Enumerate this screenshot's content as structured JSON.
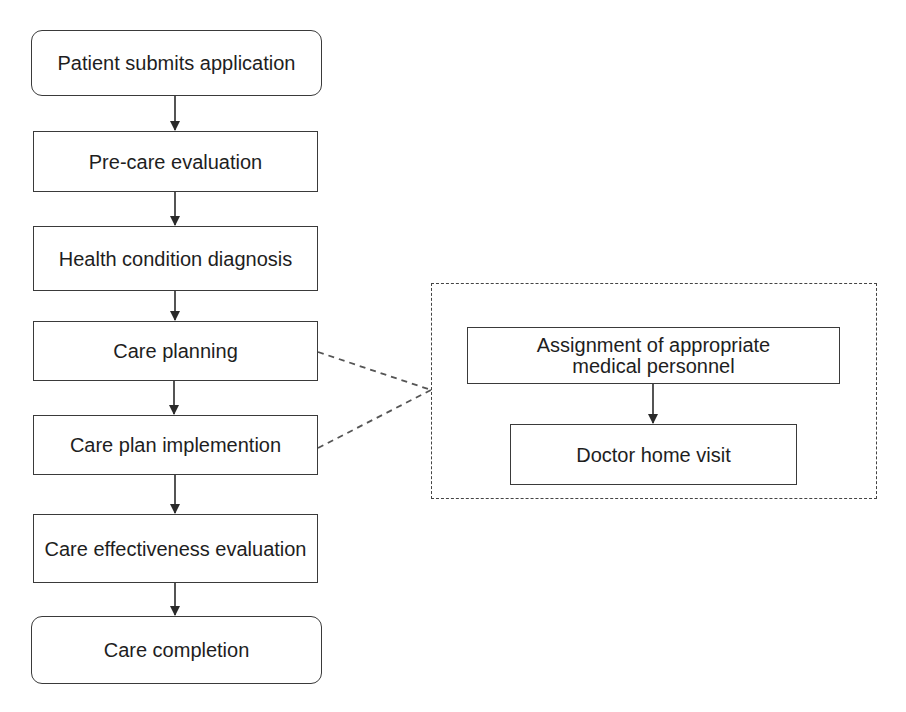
{
  "diagram": {
    "type": "flowchart",
    "main_flow": [
      {
        "id": "step1",
        "label": "Patient submits application",
        "shape": "rounded"
      },
      {
        "id": "step2",
        "label": "Pre-care evaluation",
        "shape": "rect"
      },
      {
        "id": "step3",
        "label": "Health condition diagnosis",
        "shape": "rect"
      },
      {
        "id": "step4",
        "label": "Care planning",
        "shape": "rect"
      },
      {
        "id": "step5",
        "label": "Care plan implemention",
        "shape": "rect"
      },
      {
        "id": "step6",
        "label": "Care effectiveness evaluation",
        "shape": "rect"
      },
      {
        "id": "step7",
        "label": "Care completion",
        "shape": "rounded"
      }
    ],
    "detail_group": {
      "linked_from": [
        "Care planning",
        "Care plan implemention"
      ],
      "steps": [
        {
          "id": "detail1",
          "label": "Assignment of appropriate medical personnel"
        },
        {
          "id": "detail2",
          "label": "Doctor home visit"
        }
      ]
    },
    "colors": {
      "stroke": "#3a3a3a",
      "text": "#1e1e1e",
      "background": "#ffffff"
    }
  }
}
